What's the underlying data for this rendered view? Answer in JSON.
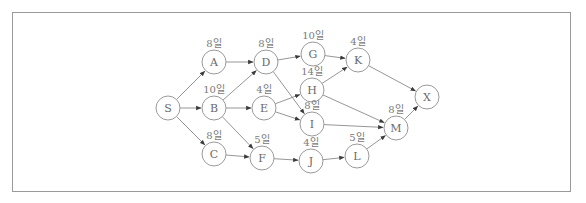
{
  "diagram": {
    "type": "activity-network",
    "unit": "일",
    "nodes": [
      {
        "id": "S",
        "label": "S",
        "duration": "",
        "x": 168,
        "y": 108
      },
      {
        "id": "A",
        "label": "A",
        "duration": "8일",
        "x": 214,
        "y": 62
      },
      {
        "id": "B",
        "label": "B",
        "duration": "10일",
        "x": 214,
        "y": 108
      },
      {
        "id": "C",
        "label": "C",
        "duration": "8일",
        "x": 214,
        "y": 154
      },
      {
        "id": "D",
        "label": "D",
        "duration": "8일",
        "x": 266,
        "y": 62
      },
      {
        "id": "E",
        "label": "E",
        "duration": "4일",
        "x": 264,
        "y": 108
      },
      {
        "id": "F",
        "label": "F",
        "duration": "5일",
        "x": 262,
        "y": 158
      },
      {
        "id": "G",
        "label": "G",
        "duration": "10일",
        "x": 313,
        "y": 54
      },
      {
        "id": "H",
        "label": "H",
        "duration": "14일",
        "x": 312,
        "y": 90
      },
      {
        "id": "I",
        "label": "I",
        "duration": "8일",
        "x": 312,
        "y": 124
      },
      {
        "id": "J",
        "label": "J",
        "duration": "4일",
        "x": 311,
        "y": 161
      },
      {
        "id": "K",
        "label": "K",
        "duration": "4일",
        "x": 358,
        "y": 60
      },
      {
        "id": "L",
        "label": "L",
        "duration": "5일",
        "x": 357,
        "y": 156
      },
      {
        "id": "M",
        "label": "M",
        "duration": "8일",
        "x": 396,
        "y": 128
      },
      {
        "id": "X",
        "label": "X",
        "duration": "",
        "x": 427,
        "y": 97
      }
    ],
    "edges": [
      [
        "S",
        "A"
      ],
      [
        "S",
        "B"
      ],
      [
        "S",
        "C"
      ],
      [
        "A",
        "D"
      ],
      [
        "B",
        "D"
      ],
      [
        "B",
        "E"
      ],
      [
        "B",
        "F"
      ],
      [
        "C",
        "F"
      ],
      [
        "D",
        "G"
      ],
      [
        "D",
        "I"
      ],
      [
        "E",
        "H"
      ],
      [
        "E",
        "I"
      ],
      [
        "F",
        "J"
      ],
      [
        "G",
        "K"
      ],
      [
        "H",
        "K"
      ],
      [
        "H",
        "M"
      ],
      [
        "I",
        "M"
      ],
      [
        "J",
        "L"
      ],
      [
        "L",
        "M"
      ],
      [
        "K",
        "X"
      ],
      [
        "M",
        "X"
      ]
    ],
    "colors": {
      "stroke": "#9a9a9a",
      "edge": "#8a8a8a",
      "text": "#6a6a6a",
      "background": "#ffffff"
    }
  }
}
